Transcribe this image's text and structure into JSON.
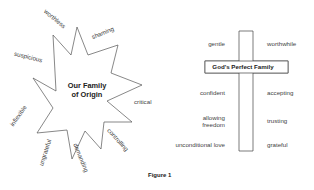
{
  "star": {
    "title_line1": "Our Family",
    "title_line2": "of Origin",
    "labels": {
      "worthless": "worthless",
      "shaming": "shaming",
      "suspicious": "suspicious",
      "critical": "critical",
      "inflexible": "inflexible",
      "controlling": "controlling",
      "ungrateful": "ungrateful",
      "demanding": "demanding"
    }
  },
  "cross": {
    "title": "God's Perfect Family",
    "left": [
      "gentle",
      "confident",
      "allowing",
      "freedom",
      "unconditional love"
    ],
    "right": [
      "worthwhile",
      "accepting",
      "trusting",
      "grateful"
    ]
  },
  "caption": "Figure 1"
}
